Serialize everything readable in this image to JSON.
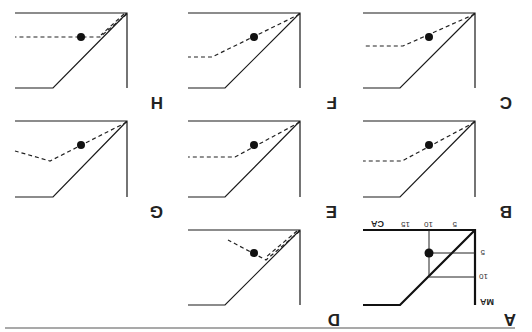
{
  "figure": {
    "orientation": "rotated 180 degrees",
    "rule_color": "#555555",
    "panels": [
      {
        "id": "A",
        "label": "A",
        "x_axis_label": "CA",
        "y_axis_label": "MA",
        "x_ticks": [
          "5",
          "10",
          "15"
        ],
        "y_ticks": [
          "5",
          "10"
        ]
      },
      {
        "id": "B",
        "label": "B"
      },
      {
        "id": "C",
        "label": "C"
      },
      {
        "id": "D",
        "label": "D"
      },
      {
        "id": "E",
        "label": "E"
      },
      {
        "id": "F",
        "label": "F"
      },
      {
        "id": "G",
        "label": "G"
      },
      {
        "id": "H",
        "label": "H"
      }
    ]
  }
}
